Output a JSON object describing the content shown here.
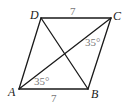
{
  "figure": {
    "type": "parallelogram",
    "vertices": {
      "A": "A",
      "B": "B",
      "C": "C",
      "D": "D"
    },
    "edges": [
      "AB",
      "BC",
      "CD",
      "DA"
    ],
    "diagonals": [
      "AC",
      "BD"
    ],
    "side_labels": {
      "DC": "7",
      "AB": "7"
    },
    "angle_labels": {
      "angle_ACD_region_at_C": "35°",
      "angle_CAB_at_A": "35°"
    },
    "colors": {
      "line": "#1a1a1a",
      "measure_text": "#777777"
    }
  }
}
